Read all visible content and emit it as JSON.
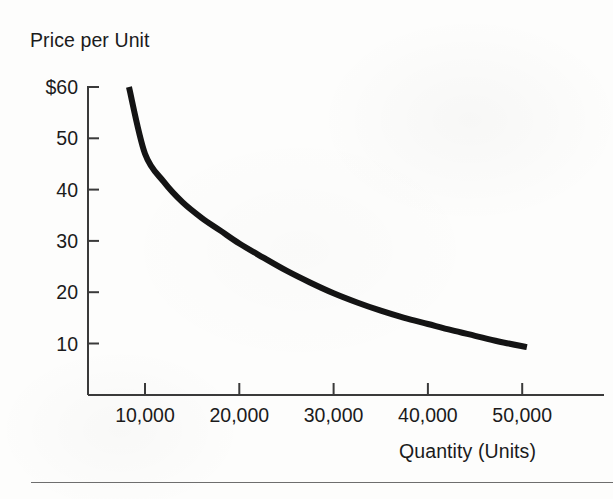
{
  "figure": {
    "background_color": "#fdfdfc",
    "ink_color": "#141414",
    "axis_color": "#3a3a3a",
    "rule_color": "#6e6e6e"
  },
  "axes": {
    "y_title": "Price per Unit",
    "x_title": "Quantity (Units)",
    "y_tick_labels": [
      "$60",
      "50",
      "40",
      "30",
      "20",
      "10"
    ],
    "x_tick_labels": [
      "10,000",
      "20,000",
      "30,000",
      "40,000",
      "50,000"
    ]
  },
  "chart_data": {
    "type": "line",
    "title": "",
    "subtitle": "",
    "xlabel": "Quantity (Units)",
    "ylabel": "Price per Unit",
    "xlim": [
      0,
      57000
    ],
    "ylim": [
      0,
      63
    ],
    "grid": false,
    "legend": null,
    "x_tick_values": [
      10000,
      20000,
      30000,
      40000,
      50000
    ],
    "x_tick_labels": [
      "10,000",
      "20,000",
      "30,000",
      "40,000",
      "50,000"
    ],
    "y_tick_values": [
      10,
      20,
      30,
      40,
      50,
      60
    ],
    "y_tick_labels": [
      "10",
      "20",
      "30",
      "40",
      "50",
      "$60"
    ],
    "y_tick_prefix": "$",
    "annotations": [],
    "series": [
      {
        "name": "Demand curve",
        "color": "#141414",
        "line_width": 6,
        "x": [
          8300,
          10000,
          12000,
          14000,
          16000,
          18000,
          20000,
          22500,
          25000,
          27500,
          30000,
          32500,
          35000,
          37500,
          40000,
          42500,
          45000,
          47500,
          50500
        ],
        "y": [
          60.0,
          47.0,
          41.5,
          37.5,
          34.5,
          32.0,
          29.5,
          26.8,
          24.2,
          21.9,
          19.8,
          18.0,
          16.4,
          15.0,
          13.8,
          12.6,
          11.5,
          10.4,
          9.3
        ]
      }
    ]
  }
}
